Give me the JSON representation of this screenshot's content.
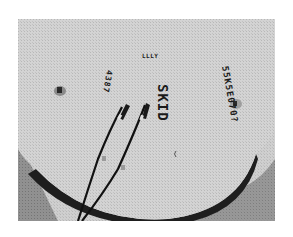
{
  "figure": {
    "type": "photograph",
    "labels": {
      "skid": "SKID",
      "serial": "55K5E070?",
      "top_mark": "LLLY",
      "left_mark": "4387"
    },
    "caption": ""
  },
  "colors": {
    "background": "#ffffff",
    "disc_surface": "#cfcfcf",
    "shadow": "#3c3c3c",
    "ink": "#1a1a1a"
  }
}
